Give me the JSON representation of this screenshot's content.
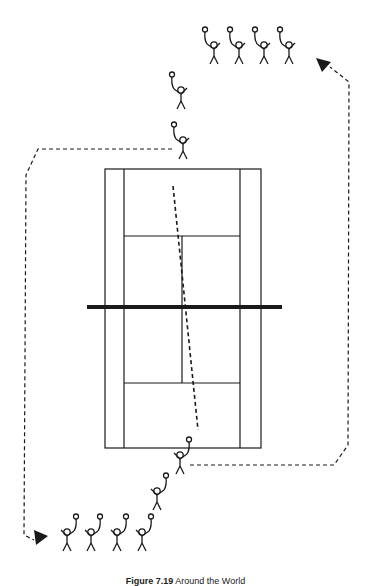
{
  "figure": {
    "caption_label": "Figure 7.19",
    "caption_title": "Around the World"
  },
  "colors": {
    "ink": "#1a1a1a",
    "background": "#ffffff"
  },
  "diagram": {
    "type": "tennis drill diagram",
    "elements": [
      "tennis court (doubles lines, service boxes, net)",
      "queue of 4 players top right",
      "queue of 4 players bottom left",
      "player at far baseline",
      "player waiting behind far baseline",
      "player at near baseline",
      "player waiting behind near baseline",
      "dashed ball path across court",
      "dashed rotation path with arrows"
    ]
  }
}
